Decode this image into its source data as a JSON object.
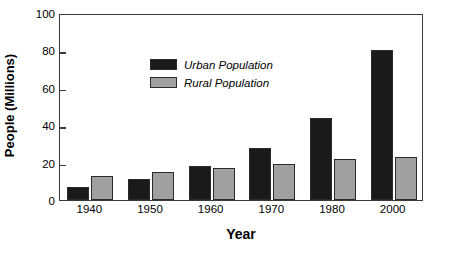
{
  "chart_data": {
    "type": "bar",
    "title": "",
    "xlabel": "Year",
    "ylabel": "People (Millions)",
    "categories": [
      "1940",
      "1950",
      "1960",
      "1970",
      "1980",
      "2000"
    ],
    "series": [
      {
        "name": "Urban Population",
        "color": "#1a1a1a",
        "values": [
          7,
          11,
          18,
          28,
          44,
          80
        ]
      },
      {
        "name": "Rural Population",
        "color": "#a0a0a0",
        "values": [
          13,
          15,
          17,
          19,
          22,
          23
        ]
      }
    ],
    "ylim": [
      0,
      100
    ],
    "yticks": [
      0,
      20,
      40,
      60,
      80,
      100
    ],
    "ytick_labels": [
      "0",
      "20",
      "40",
      "60",
      "80",
      "100"
    ],
    "grid": false,
    "legend_position": "upper-left-inside",
    "legend_entries": [
      "Urban Population",
      "Rural Population"
    ],
    "axis_color": "#3a3a3a",
    "bar_edge_color": "#2b2b2b",
    "background_color": "#ffffff"
  }
}
